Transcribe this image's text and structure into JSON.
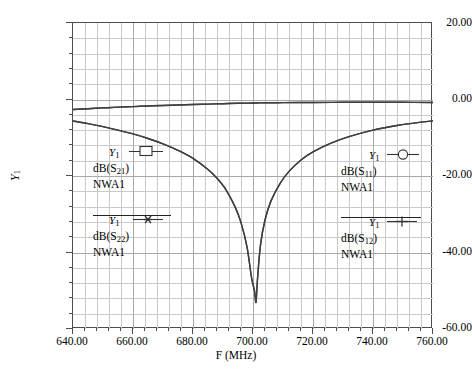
{
  "chart_data": {
    "type": "line",
    "title": "",
    "xlabel": "F (MHz)",
    "ylabel": "Y1",
    "xlim": [
      640,
      760
    ],
    "ylim": [
      -60,
      20
    ],
    "xticks": [
      "640.00",
      "660.00",
      "680.00",
      "700.00",
      "720.00",
      "740.00",
      "760.00"
    ],
    "yticks": [
      "20.00",
      "0.00",
      "-20.00",
      "-40.00",
      "-60.00"
    ],
    "xtick_values": [
      640,
      660,
      680,
      700,
      720,
      740,
      760
    ],
    "ytick_values": [
      20,
      0,
      -20,
      -40,
      -60
    ],
    "x_minor_per_major": 5,
    "y_minor_per_major": 5,
    "grid": true,
    "legend_position": "inside-plot",
    "series": [
      {
        "name": "dB(S11) NWA1",
        "marker": "circle",
        "axis": "Y1",
        "x": [
          640,
          645,
          650,
          655,
          660,
          665,
          670,
          675,
          680,
          685,
          690,
          695,
          698,
          700,
          701,
          702,
          705,
          710,
          715,
          720,
          730,
          740,
          750,
          760
        ],
        "values": [
          -2.6,
          -2.4,
          -2.2,
          -2.0,
          -1.85,
          -1.7,
          -1.55,
          -1.42,
          -1.3,
          -1.2,
          -1.1,
          -1.0,
          -0.95,
          -0.92,
          -0.9,
          -0.89,
          -0.86,
          -0.82,
          -0.79,
          -0.77,
          -0.73,
          -0.72,
          -0.73,
          -0.8
        ]
      },
      {
        "name": "dB(S22) NWA1",
        "marker": "asterisk",
        "axis": "Y1",
        "x": [
          640,
          645,
          650,
          655,
          660,
          665,
          670,
          675,
          680,
          685,
          690,
          695,
          698,
          700,
          701,
          702,
          705,
          710,
          715,
          720,
          730,
          740,
          750,
          760
        ],
        "values": [
          -2.6,
          -2.4,
          -2.2,
          -2.0,
          -1.85,
          -1.7,
          -1.55,
          -1.42,
          -1.3,
          -1.2,
          -1.1,
          -1.0,
          -0.95,
          -0.92,
          -0.9,
          -0.89,
          -0.86,
          -0.82,
          -0.79,
          -0.77,
          -0.73,
          -0.72,
          -0.73,
          -0.8
        ]
      },
      {
        "name": "dB(S21) NWA1",
        "marker": "square",
        "axis": "Y1",
        "x": [
          640,
          645,
          650,
          655,
          660,
          665,
          670,
          675,
          680,
          685,
          688,
          691,
          694,
          696,
          698,
          699.5,
          700.5,
          701,
          701.5,
          702.5,
          704,
          706,
          709,
          712,
          716,
          720,
          726,
          732,
          740,
          748,
          756,
          760
        ],
        "values": [
          -5.6,
          -6.3,
          -7.1,
          -8.0,
          -9.0,
          -10.2,
          -11.6,
          -13.3,
          -15.4,
          -18.3,
          -20.6,
          -23.6,
          -28.0,
          -32.2,
          -38.5,
          -46.5,
          -50.0,
          -53.0,
          -47.0,
          -38.0,
          -31.5,
          -26.5,
          -22.0,
          -18.8,
          -15.8,
          -13.7,
          -11.4,
          -9.7,
          -8.0,
          -6.8,
          -5.9,
          -5.6
        ]
      },
      {
        "name": "dB(S12) NWA1",
        "marker": "plus",
        "axis": "Y1",
        "x": [
          640,
          645,
          650,
          655,
          660,
          665,
          670,
          675,
          680,
          685,
          688,
          691,
          694,
          696,
          698,
          699.5,
          700.5,
          701,
          701.5,
          702.5,
          704,
          706,
          709,
          712,
          716,
          720,
          726,
          732,
          740,
          748,
          756,
          760
        ],
        "values": [
          -5.6,
          -6.3,
          -7.1,
          -8.0,
          -9.0,
          -10.2,
          -11.6,
          -13.3,
          -15.4,
          -18.3,
          -20.6,
          -23.6,
          -28.0,
          -32.2,
          -38.5,
          -46.5,
          -50.0,
          -53.0,
          -47.0,
          -38.0,
          -31.5,
          -26.5,
          -22.0,
          -18.8,
          -15.8,
          -13.7,
          -11.4,
          -9.7,
          -8.0,
          -6.8,
          -5.9,
          -5.6
        ]
      }
    ],
    "notch": {
      "frequency_mhz": 701,
      "depth_db": -53
    }
  },
  "axes": {
    "y_title_base": "Y",
    "y_title_sub": "1",
    "x_title": "F (MHz)",
    "yticks": [
      "20.00",
      "0.00",
      "-20.00",
      "-40.00",
      "-60.00"
    ],
    "xticks": [
      "640.00",
      "660.00",
      "680.00",
      "700.00",
      "720.00",
      "740.00",
      "760.00"
    ]
  },
  "legends": [
    {
      "id": "s21",
      "axis_label_base": "Y",
      "axis_label_sub": "1",
      "marker": "square-marker",
      "trace_prefix": "dB(S",
      "trace_sub": "21",
      "trace_suffix": ")",
      "instrument": "NWA1",
      "overline": false
    },
    {
      "id": "s22",
      "axis_label_base": "Y",
      "axis_label_sub": "1",
      "marker": "asterisk-marker",
      "trace_prefix": "dB(S",
      "trace_sub": "22",
      "trace_suffix": ")",
      "instrument": "NWA1",
      "overline": true
    },
    {
      "id": "s11",
      "axis_label_base": "Y",
      "axis_label_sub": "1",
      "marker": "circle-marker",
      "trace_prefix": "dB(S",
      "trace_sub": "11",
      "trace_suffix": ")",
      "instrument": "NWA1",
      "overline": false
    },
    {
      "id": "s12",
      "axis_label_base": "Y",
      "axis_label_sub": "1",
      "marker": "plus-marker",
      "trace_prefix": "dB(S",
      "trace_sub": "12",
      "trace_suffix": ")",
      "instrument": "NWA1",
      "overline": true
    }
  ],
  "colors": {
    "curve": "#3f3f3f",
    "grid_minor": "#c9c9c9",
    "grid_major": "#a8a8a8",
    "frame": "#4d4d4d",
    "text": "#000000",
    "background": "#ffffff"
  }
}
